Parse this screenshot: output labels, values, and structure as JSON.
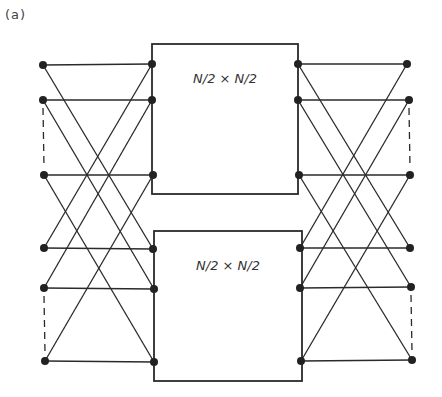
{
  "figure": {
    "label": "(a)"
  },
  "style": {
    "line_color": "#2a2a2a",
    "node_color": "#222222",
    "background": "#ffffff"
  },
  "boxes": [
    {
      "id": "upper",
      "label": "N/2 × N/2",
      "x": 152,
      "y": 44,
      "w": 146,
      "h": 150
    },
    {
      "id": "lower",
      "label": "N/2 × N/2",
      "x": 154,
      "y": 231,
      "w": 148,
      "h": 150
    }
  ],
  "nodes": {
    "left_inputs": [
      {
        "x": 43,
        "y": 65
      },
      {
        "x": 43,
        "y": 100
      },
      {
        "x": 44,
        "y": 175
      },
      {
        "x": 44,
        "y": 248
      },
      {
        "x": 44,
        "y": 288
      },
      {
        "x": 45,
        "y": 361
      }
    ],
    "upper_box_in": [
      {
        "x": 152,
        "y": 64
      },
      {
        "x": 152,
        "y": 100
      },
      {
        "x": 153,
        "y": 175
      }
    ],
    "lower_box_in": [
      {
        "x": 153,
        "y": 249
      },
      {
        "x": 154,
        "y": 289
      },
      {
        "x": 154,
        "y": 362
      }
    ],
    "upper_box_out": [
      {
        "x": 298,
        "y": 64
      },
      {
        "x": 298,
        "y": 100
      },
      {
        "x": 299,
        "y": 175
      }
    ],
    "lower_box_out": [
      {
        "x": 300,
        "y": 248
      },
      {
        "x": 300,
        "y": 288
      },
      {
        "x": 301,
        "y": 361
      }
    ],
    "right_outputs": [
      {
        "x": 407,
        "y": 64
      },
      {
        "x": 409,
        "y": 100
      },
      {
        "x": 410,
        "y": 175
      },
      {
        "x": 410,
        "y": 248
      },
      {
        "x": 411,
        "y": 287
      },
      {
        "x": 412,
        "y": 360
      }
    ]
  },
  "dashed_gaps": [
    {
      "side": "left",
      "from": [
        43,
        100
      ],
      "to": [
        44,
        175
      ]
    },
    {
      "side": "left",
      "from": [
        44,
        288
      ],
      "to": [
        45,
        361
      ]
    },
    {
      "side": "right",
      "from": [
        409,
        100
      ],
      "to": [
        410,
        175
      ]
    },
    {
      "side": "right",
      "from": [
        411,
        287
      ],
      "to": [
        412,
        360
      ]
    }
  ]
}
